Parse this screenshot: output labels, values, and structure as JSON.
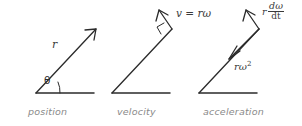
{
  "figure": {
    "background_color": "#ffffff",
    "line_color": "#2b2b2b",
    "caption_color": "#8a8a8a",
    "label_color": "#3a3a3a",
    "width": 302,
    "height": 126
  },
  "panels": [
    {
      "name": "position",
      "caption": "position",
      "angle_label": "θ",
      "vector_label": "r",
      "description": "radius vector from origin with angle theta above horizontal baseline"
    },
    {
      "name": "velocity",
      "caption": "velocity",
      "vector_label": "v = rω",
      "right_angle_marker": true,
      "description": "velocity vector perpendicular to the radius at its tip"
    },
    {
      "name": "acceleration",
      "caption": "acceleration",
      "tangential_label": {
        "lead": "r",
        "numerator": "dω",
        "denominator": "dt"
      },
      "centripetal_label": {
        "base": "rω",
        "exponent": "2"
      },
      "description": "tangential acceleration r dw/dt outward and centripetal acceleration r omega squared inward along the radius"
    }
  ]
}
